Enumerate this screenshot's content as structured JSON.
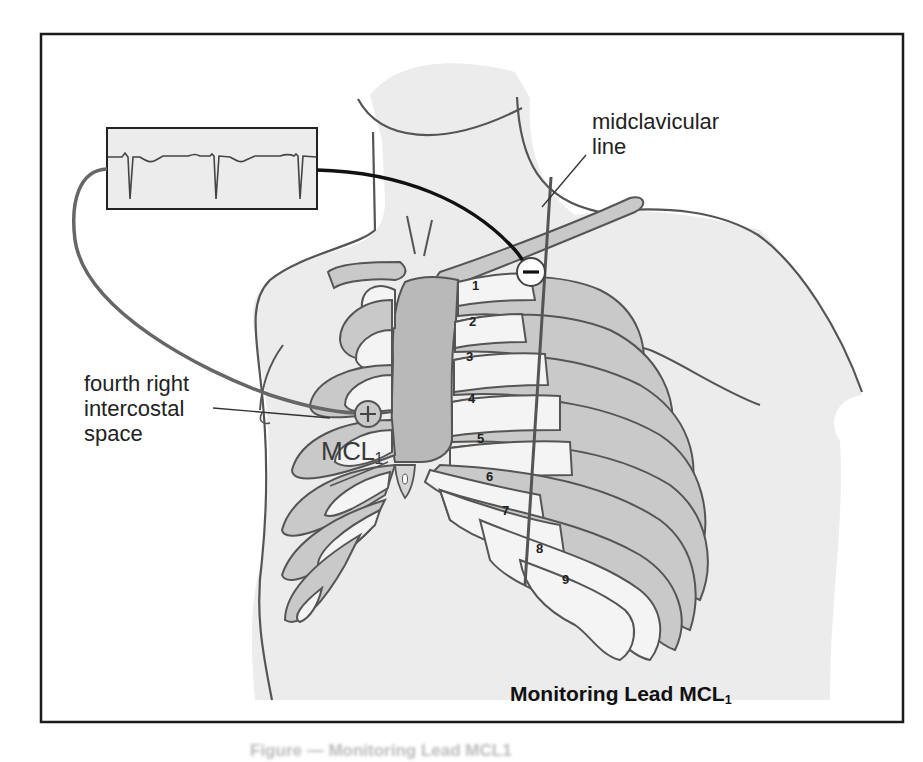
{
  "figure": {
    "title": "Monitoring Lead MCL",
    "title_subscript": "1",
    "caption_partial": "Figure — Monitoring Lead MCL1",
    "colors": {
      "border": "#1a1a1a",
      "skin": "#ececec",
      "rib_light": "#f4f4f4",
      "rib_cartilage": "#c9c9c9",
      "sternum": "#b9b9b9",
      "outline": "#555555",
      "wire": "#6a6a6a",
      "wire_dark": "#111111"
    }
  },
  "labels": {
    "midclavicular_line_1": "midclavicular",
    "midclavicular_line_2": "line",
    "fourth_1": "fourth right",
    "fourth_2": "intercostal",
    "fourth_3": "space",
    "mcl": "MCL",
    "mcl_sub": "1"
  },
  "electrodes": {
    "positive": {
      "symbol": "+",
      "position": "fourth right intercostal space"
    },
    "negative": {
      "symbol": "−",
      "position": "left midclavicular line, below clavicle"
    }
  },
  "ecg_monitor": {
    "complexes": 3,
    "waveform": "negative QRS deflections (MCL1)"
  },
  "ribs": [
    "1",
    "2",
    "3",
    "4",
    "5",
    "6",
    "7",
    "8",
    "9"
  ]
}
